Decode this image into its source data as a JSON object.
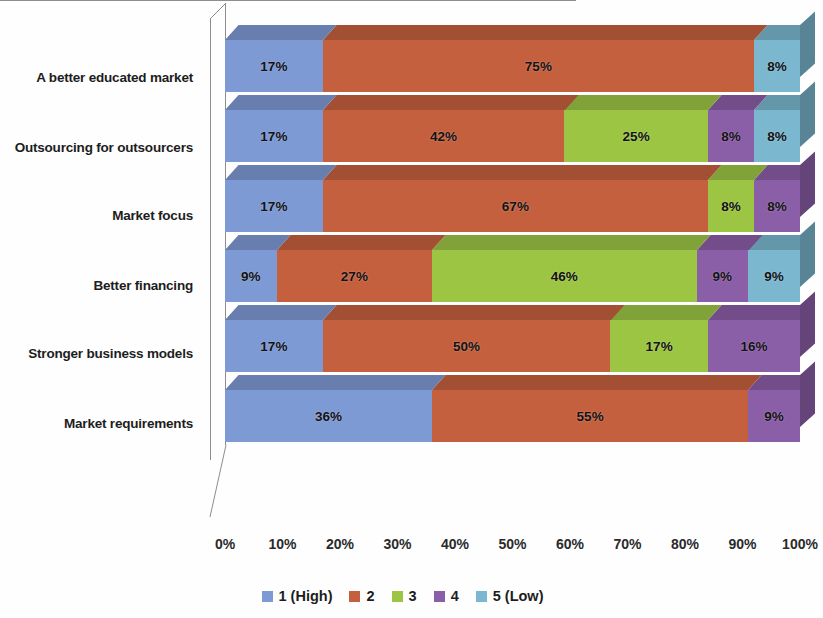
{
  "chart_data": {
    "type": "bar",
    "orientation": "horizontal",
    "stacked": true,
    "normalized": true,
    "style": "3d",
    "title": "",
    "xlabel": "",
    "ylabel": "",
    "xlim": [
      0,
      100
    ],
    "xticks": [
      "0%",
      "10%",
      "20%",
      "30%",
      "40%",
      "50%",
      "60%",
      "70%",
      "80%",
      "90%",
      "100%"
    ],
    "grid": false,
    "legend_position": "bottom",
    "categories": [
      "A better educated market",
      "Outsourcing for outsourcers",
      "Market focus",
      "Better financing",
      "Stronger business models",
      "Market requirements"
    ],
    "series": [
      {
        "name": "1 (High)",
        "color": "#7d9ad4",
        "values": [
          17,
          17,
          17,
          9,
          17,
          36
        ]
      },
      {
        "name": "2",
        "color": "#c5603f",
        "values": [
          75,
          42,
          67,
          27,
          50,
          55
        ]
      },
      {
        "name": "3",
        "color": "#9dc544",
        "values": [
          0,
          25,
          8,
          46,
          17,
          0
        ]
      },
      {
        "name": "4",
        "color": "#8b5ea8",
        "values": [
          0,
          8,
          8,
          9,
          16,
          9
        ]
      },
      {
        "name": "5 (Low)",
        "color": "#7bb8d0",
        "values": [
          8,
          8,
          0,
          9,
          0,
          0
        ]
      }
    ],
    "data_labels": [
      [
        "17%",
        "75%",
        "",
        "",
        "8%"
      ],
      [
        "17%",
        "42%",
        "25%",
        "8%",
        "8%"
      ],
      [
        "17%",
        "67%",
        "8%",
        "8%",
        ""
      ],
      [
        "9%",
        "27%",
        "46%",
        "9%",
        "9%"
      ],
      [
        "17%",
        "50%",
        "17%",
        "16%",
        ""
      ],
      [
        "36%",
        "55%",
        "",
        "9%",
        ""
      ]
    ]
  }
}
